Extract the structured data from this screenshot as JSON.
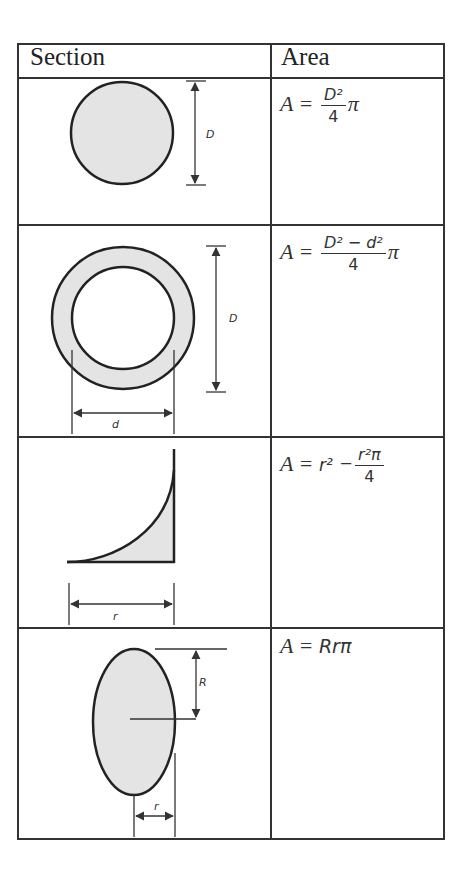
{
  "table": {
    "headers": [
      "Section",
      "Area"
    ],
    "rows": [
      {
        "section": "solid-circle",
        "dimension_labels": [
          "D"
        ],
        "formula": {
          "lhs": "A =",
          "numerator": "D²",
          "denominator": "4",
          "suffix": "π"
        }
      },
      {
        "section": "hollow-circle",
        "dimension_labels": [
          "D",
          "d"
        ],
        "formula": {
          "lhs": "A =",
          "numerator": "D² − d²",
          "denominator": "4",
          "suffix": "π"
        }
      },
      {
        "section": "spandrel",
        "dimension_labels": [
          "r"
        ],
        "formula": {
          "lhs": "A =",
          "term": "r²",
          "minus": "−",
          "numerator": "r²π",
          "denominator": "4"
        }
      },
      {
        "section": "ellipse",
        "dimension_labels": [
          "R",
          "r"
        ],
        "formula": {
          "lhs": "A =",
          "expr": "Rrπ"
        }
      }
    ]
  },
  "colors": {
    "line": "#333333",
    "fill": "#e4e4e4"
  }
}
